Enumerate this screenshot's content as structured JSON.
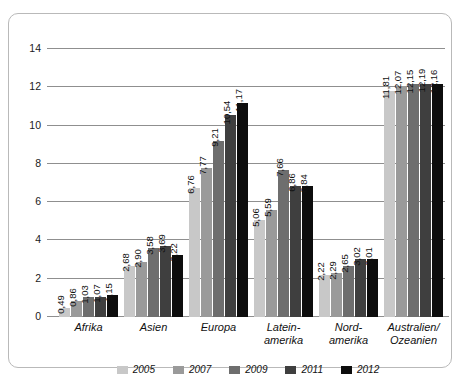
{
  "chart_data": {
    "type": "bar",
    "title": "",
    "subtitle": "",
    "xlabel": "",
    "ylabel": "",
    "ylim": [
      0,
      14
    ],
    "yticks": [
      0,
      2,
      4,
      6,
      8,
      10,
      12,
      14
    ],
    "ytick_labels": [
      "0",
      "2",
      "4",
      "6",
      "8",
      "10",
      "12",
      "14"
    ],
    "grid": true,
    "legend_position": "bottom-center",
    "decimal_separator": ",",
    "categories": [
      "Afrika",
      "Asien",
      "Europa",
      "Latein-\namerika",
      "Nord-\namerika",
      "Australien/\nOzeanien"
    ],
    "category_lines": [
      [
        "Afrika"
      ],
      [
        "Asien"
      ],
      [
        "Europa"
      ],
      [
        "Latein-",
        "amerika"
      ],
      [
        "Nord-",
        "amerika"
      ],
      [
        "Australien/",
        "Ozeanien"
      ]
    ],
    "series": [
      {
        "name": "2005",
        "color": "#c8c8c8",
        "values": [
          0.49,
          2.68,
          6.76,
          5.06,
          2.22,
          11.81
        ],
        "labels": [
          "0,49",
          "2,68",
          "6,76",
          "5,06",
          "2,22",
          "11,81"
        ]
      },
      {
        "name": "2007",
        "color": "#9a9a9a",
        "values": [
          0.86,
          2.9,
          7.77,
          5.59,
          2.29,
          12.07
        ],
        "labels": [
          "0,86",
          "2,90",
          "7,77",
          "5,59",
          "2,29",
          "12,07"
        ]
      },
      {
        "name": "2009",
        "color": "#6e6e6e",
        "values": [
          1.03,
          3.58,
          9.21,
          7.66,
          2.65,
          12.15
        ],
        "labels": [
          "1,03",
          "3,58",
          "9,21",
          "7,66",
          "2,65",
          "12,15"
        ]
      },
      {
        "name": "2011",
        "color": "#3f3f3f",
        "values": [
          1.07,
          3.69,
          10.54,
          6.86,
          3.02,
          12.19
        ],
        "labels": [
          "1,07",
          "3,69",
          "10,54",
          "6,86",
          "3,02",
          "12,19"
        ]
      },
      {
        "name": "2012",
        "color": "#0d0d0d",
        "values": [
          1.15,
          3.22,
          11.17,
          6.84,
          3.01,
          12.16
        ],
        "labels": [
          "1,15",
          "3,22",
          "11,17",
          "6,84",
          "3,01",
          "12,16"
        ]
      }
    ]
  },
  "legend": {
    "items": [
      {
        "label": "2005",
        "color": "#c8c8c8"
      },
      {
        "label": "2007",
        "color": "#9a9a9a"
      },
      {
        "label": "2009",
        "color": "#6e6e6e"
      },
      {
        "label": "2011",
        "color": "#3f3f3f"
      },
      {
        "label": "2012",
        "color": "#0d0d0d"
      }
    ]
  },
  "style": {
    "frame_border_color": "#b9b9b9",
    "gridline_color": "#8f8f8f",
    "background": "#ffffff",
    "text_color": "#111111"
  }
}
